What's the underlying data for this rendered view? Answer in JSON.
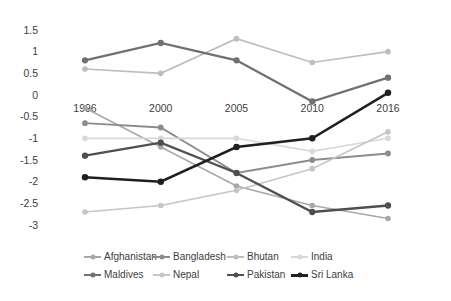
{
  "chart_data": {
    "type": "line",
    "x": [
      "1996",
      "2000",
      "2005",
      "2010",
      "2016"
    ],
    "ylim": [
      -3,
      1.5
    ],
    "yticks": [
      1.5,
      1,
      0.5,
      0,
      -0.5,
      -1,
      -1.5,
      -2,
      -2.5,
      -3
    ],
    "ytick_labels": [
      "1.5",
      "1",
      "0.5",
      "0",
      "-0.5",
      "-1",
      "-1.5",
      "-2",
      "-2.5",
      "-3"
    ],
    "grid": false,
    "legend_position": "bottom",
    "title": "",
    "xlabel": "",
    "ylabel": "",
    "series": [
      {
        "name": "Afghanistan",
        "color": "#a8a8a8",
        "width": 1.6,
        "values": [
          -0.3,
          -1.2,
          -2.1,
          -2.55,
          -2.85
        ]
      },
      {
        "name": "Bangladesh",
        "color": "#8c8c8c",
        "width": 1.8,
        "values": [
          -0.65,
          -0.75,
          -1.8,
          -1.5,
          -1.35
        ]
      },
      {
        "name": "Bhutan",
        "color": "#bdbdbd",
        "width": 1.6,
        "values": [
          0.6,
          0.5,
          1.3,
          0.75,
          1.0
        ]
      },
      {
        "name": "India",
        "color": "#d8d8d8",
        "width": 1.6,
        "values": [
          -1.0,
          -1.0,
          -1.0,
          -1.3,
          -1.0
        ]
      },
      {
        "name": "Maldives",
        "color": "#707070",
        "width": 2.3,
        "values": [
          0.8,
          1.2,
          0.8,
          -0.15,
          0.4
        ]
      },
      {
        "name": "Nepal",
        "color": "#c6c6c6",
        "width": 1.6,
        "values": [
          -2.7,
          -2.55,
          -2.2,
          -1.7,
          -0.85
        ]
      },
      {
        "name": "Pakistan",
        "color": "#4f4f4f",
        "width": 2.3,
        "values": [
          -1.4,
          -1.1,
          -1.8,
          -2.7,
          -2.55
        ]
      },
      {
        "name": "Sri Lanka",
        "color": "#1f1f1f",
        "width": 2.5,
        "values": [
          -1.9,
          -2.0,
          -1.2,
          -1.0,
          0.05
        ]
      }
    ]
  }
}
